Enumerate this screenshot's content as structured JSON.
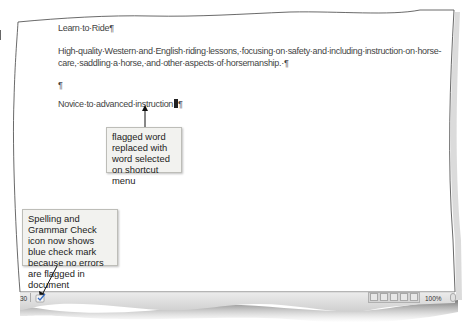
{
  "document": {
    "paragraphs": [
      "Learn·to·Ride¶",
      "High-quality·Western·and·English·riding·lessons,·focusing·on·safety·and·including·instruction·on·horse-",
      "care,·saddling·a·horse,·and·other·aspects·of·horsemanship.·¶",
      "¶",
      "Novice·to·advanced·instruction"
    ],
    "last_line_end": "¶"
  },
  "callouts": {
    "replaced_word": "flagged word replaced with word selected on shortcut menu",
    "spell_check": "Spelling and Grammar Check icon now shows blue check mark because no errors are flagged in document"
  },
  "statusbar": {
    "page_indicator": "30",
    "spell_check_icon": "spelling-grammar-check-icon",
    "view_buttons": [
      "print-layout",
      "full-screen-reading",
      "web-layout",
      "outline",
      "draft"
    ],
    "zoom_level": "100%"
  },
  "colors": {
    "callout_bg": "#f2f2ef",
    "statusbar_bg": "#dcdcdc",
    "check_blue": "#3a6fc4"
  }
}
